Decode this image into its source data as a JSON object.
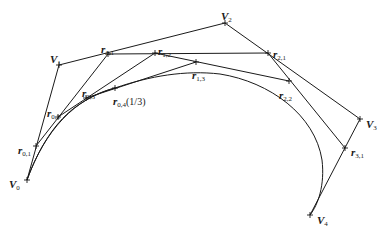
{
  "diagram": {
    "title": "",
    "stroke_color": "#1a1a1a",
    "control_points": [
      {
        "id": "V0",
        "x": 27,
        "y": 180,
        "main": "V",
        "sub": "0"
      },
      {
        "id": "V1",
        "x": 59,
        "y": 65,
        "main": "V",
        "sub": "1"
      },
      {
        "id": "V2",
        "x": 225,
        "y": 23,
        "main": "V",
        "sub": "2"
      },
      {
        "id": "V3",
        "x": 360,
        "y": 119,
        "main": "V",
        "sub": "3"
      },
      {
        "id": "V4",
        "x": 310,
        "y": 215,
        "main": "V",
        "sub": "4"
      }
    ],
    "intermediate_points": [
      {
        "id": "r01",
        "x": 36,
        "y": 146,
        "main": "r",
        "sub": "0,1"
      },
      {
        "id": "r02",
        "x": 58,
        "y": 117,
        "main": "r",
        "sub": "0,2"
      },
      {
        "id": "r03",
        "x": 86,
        "y": 98,
        "main": "r",
        "sub": "0,3"
      },
      {
        "id": "r04",
        "x": 115,
        "y": 88,
        "main": "r",
        "sub": "0,4",
        "extra": "(1/3)"
      },
      {
        "id": "r11",
        "x": 108,
        "y": 54,
        "main": "r",
        "sub": "1,1"
      },
      {
        "id": "r12",
        "x": 155,
        "y": 53,
        "main": "r",
        "sub": "1,2"
      },
      {
        "id": "r13",
        "x": 196,
        "y": 62,
        "main": "r",
        "sub": "1,3"
      },
      {
        "id": "r21",
        "x": 268,
        "y": 53,
        "main": "r",
        "sub": "2,1"
      },
      {
        "id": "r22",
        "x": 289,
        "y": 81,
        "main": "r",
        "sub": "2,2"
      },
      {
        "id": "r31",
        "x": 345,
        "y": 148,
        "main": "r",
        "sub": "3,1"
      }
    ],
    "labels": {
      "V0": {
        "main": "V",
        "sub": "0"
      },
      "V1": {
        "main": "V",
        "sub": "1"
      },
      "V2": {
        "main": "V",
        "sub": "2"
      },
      "V3": {
        "main": "V",
        "sub": "3"
      },
      "V4": {
        "main": "V",
        "sub": "4"
      },
      "r01": {
        "main": "r",
        "sub": "0,1"
      },
      "r02": {
        "main": "r",
        "sub": "0,2"
      },
      "r03": {
        "main": "r",
        "sub": "0,3"
      },
      "r04": {
        "main": "r",
        "sub": "0,4",
        "extra": "(1/3)"
      },
      "r11": {
        "main": "r",
        "sub": "1,1"
      },
      "r12": {
        "main": "r",
        "sub": "1,2"
      },
      "r13": {
        "main": "r",
        "sub": "1,3"
      },
      "r21": {
        "main": "r",
        "sub": "2,1"
      },
      "r22": {
        "main": "r",
        "sub": "2,2"
      },
      "r31": {
        "main": "r",
        "sub": "3,1"
      }
    }
  }
}
